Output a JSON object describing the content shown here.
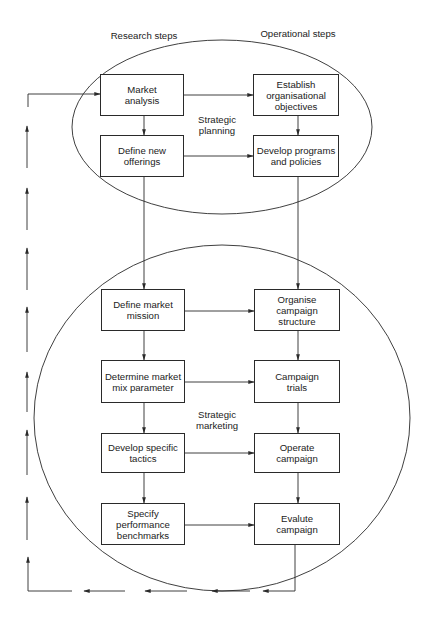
{
  "headers": {
    "left": "Research steps",
    "right": "Operational steps"
  },
  "regions": {
    "planning": "Strategic\nplanning",
    "marketing": "Strategic\nmarketing"
  },
  "boxes": {
    "market_analysis": "Market\nanalysis",
    "define_new_offerings": "Define new\nofferings",
    "establish_objectives": "Establish\norganisational\nobjectives",
    "develop_programs": "Develop programs\nand policies",
    "define_market_mission": "Define market\nmission",
    "organise_campaign": "Organise\ncampaign\nstructure",
    "determine_mix": "Determine market\nmix parameter",
    "campaign_trials": "Campaign\ntrials",
    "develop_tactics": "Develop specific\ntactics",
    "operate_campaign": "Operate\ncampaign",
    "specify_benchmarks": "Specify\nperformance\nbenchmarks",
    "evaluate_campaign": "Evalute\ncampaign"
  },
  "colors": {
    "line": "#2a2a2a",
    "text": "#222222",
    "background": "#ffffff"
  }
}
